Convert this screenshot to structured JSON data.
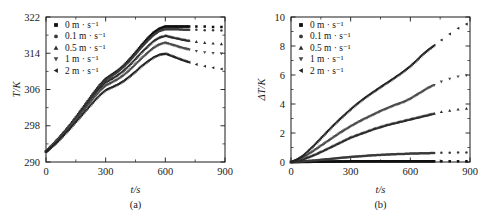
{
  "figure": {
    "background": "#ffffff",
    "ink": "#1a1a1a",
    "width": 489,
    "height": 213
  },
  "series_legend": [
    {
      "label": "0 m · s⁻¹",
      "marker": "square",
      "color": "#101010"
    },
    {
      "label": "0.1 m · s⁻¹",
      "marker": "circle",
      "color": "#3a3a3a"
    },
    {
      "label": "0.5 m · s⁻¹",
      "marker": "triangle-up",
      "color": "#2b2b2b"
    },
    {
      "label": "1 m · s⁻¹",
      "marker": "triangle-down",
      "color": "#4a4a4a"
    },
    {
      "label": "2 m · s⁻¹",
      "marker": "triangle-left",
      "color": "#222222"
    }
  ],
  "panel_a": {
    "caption": "(a)",
    "xlabel": "t/s",
    "ylabel": "T/K"
  },
  "panel_b": {
    "caption": "(b)",
    "xlabel": "t/s",
    "ylabel": "ΔT/K"
  },
  "chart_data": [
    {
      "type": "scatter",
      "panel": "a",
      "title": "",
      "caption": "(a)",
      "xlabel": "t/s",
      "ylabel": "T/K",
      "xlim": [
        0,
        900
      ],
      "ylim": [
        290,
        322
      ],
      "xticks": [
        0,
        300,
        600,
        900
      ],
      "xtick_labels": [
        "0",
        "300",
        "600",
        "900"
      ],
      "yticks": [
        290,
        298,
        306,
        314,
        322
      ],
      "ytick_labels": [
        "290",
        "298",
        "306",
        "314",
        "322"
      ],
      "minor_xticks": [
        150,
        450,
        750
      ],
      "minor_yticks": [
        294,
        302,
        310,
        318
      ],
      "grid": false,
      "legend_position": "top-left",
      "x": [
        0,
        30,
        60,
        90,
        120,
        150,
        180,
        210,
        240,
        270,
        300,
        330,
        360,
        390,
        420,
        450,
        480,
        510,
        540,
        570,
        600,
        630,
        660,
        690,
        720,
        750,
        780,
        810,
        840,
        870,
        900
      ],
      "series": [
        {
          "name": "0 m · s⁻¹",
          "marker": "square",
          "color": "#101010",
          "values": [
            292.3,
            293.6,
            295.0,
            296.5,
            298.1,
            299.8,
            301.6,
            303.4,
            305.2,
            306.9,
            308.3,
            309.2,
            310.1,
            311.2,
            312.6,
            314.1,
            315.7,
            317.2,
            318.5,
            319.4,
            319.9,
            319.9,
            319.9,
            319.9,
            319.9,
            319.9,
            319.9,
            319.9,
            319.8,
            319.8,
            319.8
          ]
        },
        {
          "name": "0.1 m · s⁻¹",
          "marker": "circle",
          "color": "#3a3a3a",
          "values": [
            292.3,
            293.6,
            295.0,
            296.5,
            298.0,
            299.7,
            301.5,
            303.3,
            305.0,
            306.7,
            308.1,
            309.0,
            309.9,
            311.0,
            312.3,
            313.8,
            315.3,
            316.7,
            318.0,
            318.9,
            319.3,
            319.3,
            319.3,
            319.2,
            319.2,
            319.2,
            319.1,
            319.1,
            319.1,
            319.0,
            319.0
          ]
        },
        {
          "name": "0.5 m · s⁻¹",
          "marker": "triangle-up",
          "color": "#2b2b2b",
          "values": [
            292.3,
            293.6,
            294.9,
            296.4,
            297.9,
            299.6,
            301.3,
            303.0,
            304.7,
            306.3,
            307.6,
            308.4,
            309.2,
            310.2,
            311.4,
            312.8,
            314.2,
            315.5,
            316.7,
            317.5,
            317.9,
            317.6,
            317.3,
            317.0,
            316.8,
            316.6,
            316.4,
            316.3,
            316.2,
            316.1,
            316.0
          ]
        },
        {
          "name": "1 m · s⁻¹",
          "marker": "triangle-down",
          "color": "#4a4a4a",
          "values": [
            292.3,
            293.5,
            294.8,
            296.2,
            297.7,
            299.3,
            300.9,
            302.5,
            304.1,
            305.6,
            306.8,
            307.5,
            308.2,
            309.1,
            310.2,
            311.5,
            312.8,
            314.0,
            315.1,
            315.9,
            316.3,
            315.9,
            315.5,
            315.1,
            314.8,
            314.5,
            314.3,
            314.1,
            314.0,
            313.9,
            313.9
          ]
        },
        {
          "name": "2 m · s⁻¹",
          "marker": "triangle-left",
          "color": "#222222",
          "values": [
            292.3,
            293.4,
            294.6,
            296.0,
            297.4,
            298.9,
            300.4,
            301.9,
            303.4,
            304.8,
            305.9,
            306.5,
            307.1,
            307.9,
            308.9,
            310.0,
            311.2,
            312.2,
            313.1,
            313.7,
            313.9,
            313.4,
            312.9,
            312.4,
            312.0,
            311.6,
            311.3,
            311.0,
            310.8,
            310.6,
            310.4
          ]
        }
      ]
    },
    {
      "type": "scatter",
      "panel": "b",
      "title": "",
      "caption": "(b)",
      "xlabel": "t/s",
      "ylabel": "ΔT/K",
      "xlim": [
        0,
        900
      ],
      "ylim": [
        0,
        10
      ],
      "xticks": [
        0,
        300,
        600,
        900
      ],
      "xtick_labels": [
        "0",
        "300",
        "600",
        "900"
      ],
      "yticks": [
        0,
        2,
        4,
        6,
        8,
        10
      ],
      "ytick_labels": [
        "0",
        "2",
        "4",
        "6",
        "8",
        "10"
      ],
      "minor_xticks": [
        150,
        450,
        750
      ],
      "minor_yticks": [
        1,
        3,
        5,
        7,
        9
      ],
      "grid": false,
      "legend_position": "top-left",
      "x": [
        0,
        30,
        60,
        90,
        120,
        150,
        180,
        210,
        240,
        270,
        300,
        330,
        360,
        390,
        420,
        450,
        480,
        510,
        540,
        570,
        600,
        630,
        660,
        690,
        720,
        750,
        780,
        810,
        840,
        870,
        900
      ],
      "series": [
        {
          "name": "0 m · s⁻¹",
          "marker": "square",
          "color": "#101010",
          "values": [
            0.0,
            0.0,
            0.01,
            0.01,
            0.02,
            0.02,
            0.03,
            0.03,
            0.04,
            0.04,
            0.05,
            0.05,
            0.05,
            0.05,
            0.05,
            0.05,
            0.05,
            0.05,
            0.05,
            0.05,
            0.05,
            0.05,
            0.05,
            0.05,
            0.05,
            0.05,
            0.05,
            0.05,
            0.05,
            0.05,
            0.05
          ]
        },
        {
          "name": "0.1 m · s⁻¹",
          "marker": "circle",
          "color": "#3a3a3a",
          "values": [
            0.0,
            0.02,
            0.05,
            0.08,
            0.11,
            0.15,
            0.19,
            0.23,
            0.27,
            0.31,
            0.35,
            0.38,
            0.41,
            0.44,
            0.47,
            0.49,
            0.51,
            0.53,
            0.55,
            0.56,
            0.58,
            0.59,
            0.6,
            0.61,
            0.62,
            0.63,
            0.64,
            0.64,
            0.65,
            0.65,
            0.65
          ]
        },
        {
          "name": "0.5 m · s⁻¹",
          "marker": "triangle-up",
          "color": "#2b2b2b",
          "values": [
            0.0,
            0.08,
            0.2,
            0.35,
            0.52,
            0.7,
            0.9,
            1.1,
            1.3,
            1.5,
            1.7,
            1.85,
            2.0,
            2.15,
            2.3,
            2.42,
            2.55,
            2.65,
            2.75,
            2.85,
            2.95,
            3.05,
            3.15,
            3.25,
            3.35,
            3.45,
            3.52,
            3.58,
            3.63,
            3.67,
            3.7
          ]
        },
        {
          "name": "1 m · s⁻¹",
          "marker": "triangle-down",
          "color": "#4a4a4a",
          "values": [
            0.0,
            0.12,
            0.3,
            0.55,
            0.82,
            1.1,
            1.38,
            1.66,
            1.94,
            2.2,
            2.45,
            2.68,
            2.9,
            3.1,
            3.3,
            3.5,
            3.68,
            3.85,
            4.0,
            4.15,
            4.35,
            4.6,
            4.85,
            5.1,
            5.3,
            5.5,
            5.65,
            5.78,
            5.88,
            5.95,
            6.0
          ]
        },
        {
          "name": "2 m · s⁻¹",
          "marker": "triangle-left",
          "color": "#222222",
          "values": [
            0.0,
            0.18,
            0.45,
            0.82,
            1.22,
            1.65,
            2.08,
            2.5,
            2.9,
            3.28,
            3.65,
            4.0,
            4.32,
            4.62,
            4.9,
            5.18,
            5.45,
            5.72,
            6.0,
            6.3,
            6.62,
            7.0,
            7.4,
            7.75,
            8.05,
            8.35,
            8.65,
            8.95,
            9.22,
            9.45,
            9.6
          ]
        }
      ]
    }
  ]
}
